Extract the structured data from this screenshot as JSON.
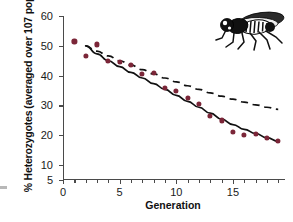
{
  "figure": {
    "background_color": "#ffffff",
    "marker_color": "#7b2638",
    "line_color": "#111111",
    "axis_color": "#4a4a4a"
  },
  "illustration": {
    "name": "drosophila-fruit-fly",
    "position": "top-right"
  },
  "chart_data": {
    "type": "scatter",
    "title": "",
    "xlabel": "Generation",
    "ylabel": "% Heterozygotes (averaged over 107 populations)",
    "ylabel_line1": "% Heterozygotes",
    "ylabel_line2": "(averaged over 107 populations)",
    "xlim": [
      0,
      19.6
    ],
    "ylim": [
      5,
      60
    ],
    "grid": false,
    "legend": "none",
    "xticks": [
      0,
      5,
      10,
      15
    ],
    "xtick_labels": [
      "0",
      "5",
      "10",
      "15"
    ],
    "xticks_minor": [
      1,
      2,
      3,
      4,
      6,
      7,
      8,
      9,
      11,
      12,
      13,
      14,
      16,
      17,
      18,
      19
    ],
    "yticks": [
      5,
      10,
      20,
      30,
      40,
      50,
      60
    ],
    "ytick_labels": [
      "5",
      "10",
      "20",
      "30",
      "40",
      "50",
      "60"
    ],
    "x": [
      1,
      2,
      3,
      4,
      5,
      6,
      7,
      8,
      9,
      10,
      11,
      12,
      13,
      14,
      15,
      16,
      17,
      18,
      19
    ],
    "series": [
      {
        "name": "Observed heterozygosity",
        "type": "scatter",
        "marker": "filled-circle",
        "color": "#7b2638",
        "values": [
          51.5,
          46.5,
          50.5,
          45.0,
          44.5,
          43.5,
          40.5,
          41.0,
          36.0,
          35.0,
          32.5,
          30.5,
          26.5,
          25.0,
          21.0,
          20.0,
          20.5,
          19.0,
          18.0
        ]
      },
      {
        "name": "Observed fit (solid line)",
        "type": "line",
        "style": "solid",
        "color": "#111111",
        "x": [
          2,
          3,
          4,
          5,
          6,
          7,
          8,
          9,
          10,
          11,
          12,
          13,
          14,
          15,
          16,
          17,
          18,
          19
        ],
        "values": [
          50.0,
          47.3,
          45.0,
          43.0,
          41.1,
          39.2,
          37.3,
          35.4,
          33.4,
          31.4,
          29.4,
          27.4,
          25.4,
          23.6,
          22.0,
          20.6,
          19.2,
          18.0
        ]
      },
      {
        "name": "Neutral expectation (dashed line)",
        "type": "line",
        "style": "dashed",
        "color": "#111111",
        "x": [
          2,
          3,
          4,
          5,
          6,
          7,
          8,
          9,
          10,
          11,
          12,
          13,
          14,
          15,
          16,
          17,
          18,
          19
        ],
        "values": [
          50.0,
          48.2,
          46.6,
          45.0,
          43.5,
          42.0,
          40.6,
          39.2,
          37.9,
          36.6,
          35.4,
          34.2,
          33.1,
          32.1,
          31.1,
          30.2,
          29.4,
          28.7
        ]
      }
    ]
  }
}
